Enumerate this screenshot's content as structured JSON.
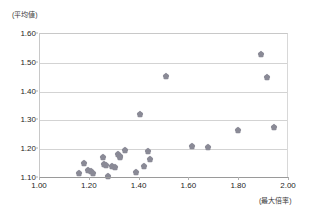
{
  "chart_data": {
    "type": "scatter",
    "title": "",
    "ylabel": "(平均値)",
    "xlabel": "(最大倍率)",
    "xlim": [
      1.0,
      2.0
    ],
    "ylim": [
      1.1,
      1.6
    ],
    "xticks": [
      "1.00",
      "1.20",
      "1.40",
      "1.60",
      "1.80",
      "2.00"
    ],
    "xtick_values": [
      1.0,
      1.2,
      1.4,
      1.6,
      1.8,
      2.0
    ],
    "yticks": [
      "1.10",
      "1.20",
      "1.30",
      "1.40",
      "1.50",
      "1.60"
    ],
    "ytick_values": [
      1.1,
      1.2,
      1.3,
      1.4,
      1.5,
      1.6
    ],
    "grid": true,
    "grid_axis": "y",
    "legend": false,
    "marker": "diamond",
    "marker_color": "#8a8a96",
    "points": [
      {
        "x": 1.155,
        "y": 1.117
      },
      {
        "x": 1.178,
        "y": 1.152
      },
      {
        "x": 1.192,
        "y": 1.127
      },
      {
        "x": 1.205,
        "y": 1.124
      },
      {
        "x": 1.213,
        "y": 1.117
      },
      {
        "x": 1.253,
        "y": 1.173
      },
      {
        "x": 1.257,
        "y": 1.15
      },
      {
        "x": 1.266,
        "y": 1.146
      },
      {
        "x": 1.272,
        "y": 1.107
      },
      {
        "x": 1.288,
        "y": 1.141
      },
      {
        "x": 1.302,
        "y": 1.139
      },
      {
        "x": 1.315,
        "y": 1.183
      },
      {
        "x": 1.32,
        "y": 1.176
      },
      {
        "x": 1.323,
        "y": 1.172
      },
      {
        "x": 1.34,
        "y": 1.196
      },
      {
        "x": 1.386,
        "y": 1.122
      },
      {
        "x": 1.4,
        "y": 1.322
      },
      {
        "x": 1.419,
        "y": 1.142
      },
      {
        "x": 1.432,
        "y": 1.194
      },
      {
        "x": 1.443,
        "y": 1.166
      },
      {
        "x": 1.507,
        "y": 1.455
      },
      {
        "x": 1.612,
        "y": 1.212
      },
      {
        "x": 1.676,
        "y": 1.206
      },
      {
        "x": 1.797,
        "y": 1.265
      },
      {
        "x": 1.888,
        "y": 1.53
      },
      {
        "x": 1.912,
        "y": 1.45
      },
      {
        "x": 1.938,
        "y": 1.278
      }
    ]
  }
}
